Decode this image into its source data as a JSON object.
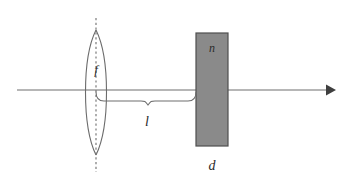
{
  "figure": {
    "type": "optics-ray-diagram",
    "canvas": {
      "width": 346,
      "height": 182,
      "background": "#ffffff"
    }
  },
  "labels": {
    "focal_length": "f",
    "distance": "l",
    "refractive_index": "n",
    "thickness": "d"
  },
  "elements": {
    "optical_axis": {
      "name": "optical-axis",
      "x_start": 17,
      "x_end": 335,
      "y": 90,
      "arrow": "right",
      "color": "#6e6e6e"
    },
    "lens": {
      "name": "biconvex-lens",
      "center_x": 96,
      "top_y": 30,
      "bottom_y": 155,
      "half_width": 12,
      "color": "#6b6b6b"
    },
    "center_axis_dashed": {
      "name": "lens-center-dashed-line",
      "x": 96,
      "top_y": 18,
      "bottom_y": 172,
      "color": "#7a7a7a"
    },
    "slab": {
      "name": "glass-slab",
      "x": 196,
      "y": 33,
      "width": 32,
      "height": 113,
      "fill": "#8a8a8a",
      "stroke": "#4f4f4f"
    },
    "distance_brace": {
      "name": "distance-brace",
      "x_start": 96,
      "x_end": 196,
      "y": 100,
      "color": "#6e6e6e"
    }
  },
  "label_positions": {
    "f": {
      "x": 96,
      "y": 74
    },
    "l": {
      "x": 147,
      "y": 126
    },
    "n": {
      "x": 212,
      "y": 52
    },
    "d": {
      "x": 212,
      "y": 170
    }
  }
}
